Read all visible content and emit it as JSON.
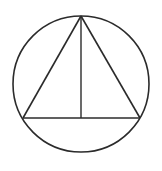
{
  "diagram": {
    "colors": {
      "background": "#ffffff",
      "stroke": "#2b2b2b"
    },
    "circle": {
      "cx": 81,
      "cy": 84,
      "r": 68
    },
    "triangle": {
      "apex": {
        "x": 81,
        "y": 16
      },
      "base_left": {
        "x": 23,
        "y": 118
      },
      "base_right": {
        "x": 140,
        "y": 118
      }
    },
    "altitude": {
      "from": {
        "x": 81,
        "y": 16
      },
      "to": {
        "x": 81,
        "y": 118
      }
    },
    "labels": []
  }
}
